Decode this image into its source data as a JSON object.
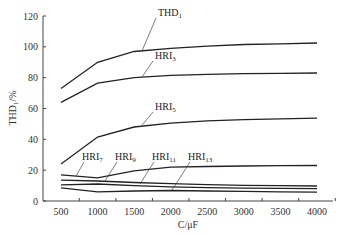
{
  "chart_data": {
    "type": "line",
    "title": "",
    "xlabel": "C/μF",
    "ylabel": "THD₁/%",
    "xlim": [
      500,
      4000
    ],
    "ylim": [
      0,
      120
    ],
    "grid": false,
    "legend": "inline labels with leader lines",
    "x_ticks": [
      500,
      1000,
      1500,
      2000,
      2500,
      3000,
      3500,
      4000
    ],
    "y_ticks": [
      0,
      20,
      40,
      60,
      80,
      100,
      120
    ],
    "series": [
      {
        "name": "THD1",
        "label_main": "THD",
        "label_sub": "1",
        "x": [
          500,
          1000,
          1500,
          2000,
          2500,
          3000,
          3500,
          4000
        ],
        "values": [
          73,
          90,
          97,
          99,
          100.5,
          101.5,
          102,
          102.5
        ]
      },
      {
        "name": "HRI3",
        "label_main": "HRI",
        "label_sub": "3",
        "x": [
          500,
          1000,
          1500,
          2000,
          2500,
          3000,
          3500,
          4000
        ],
        "values": [
          64,
          76.5,
          80,
          81.5,
          82.2,
          82.6,
          82.8,
          83
        ]
      },
      {
        "name": "HRI5",
        "label_main": "HRI",
        "label_sub": "5",
        "x": [
          500,
          1000,
          1500,
          2000,
          2500,
          3000,
          3500,
          4000
        ],
        "values": [
          24,
          41.5,
          48,
          50.5,
          52,
          52.8,
          53.3,
          53.8
        ]
      },
      {
        "name": "HRI7",
        "label_main": "HRI",
        "label_sub": "7",
        "x": [
          500,
          1000,
          1500,
          2000,
          2500,
          3000,
          3500,
          4000
        ],
        "values": [
          17,
          15,
          19.5,
          22,
          22.4,
          22.7,
          22.9,
          23
        ]
      },
      {
        "name": "HRI9",
        "label_main": "HRI",
        "label_sub": "9",
        "x": [
          500,
          1000,
          1500,
          2000,
          2500,
          3000,
          3500,
          4000
        ],
        "values": [
          13.5,
          13,
          12,
          11.2,
          10.6,
          10.2,
          9.9,
          9.7
        ]
      },
      {
        "name": "HRI11",
        "label_main": "HRI",
        "label_sub": "11",
        "x": [
          500,
          1000,
          1500,
          2000,
          2500,
          3000,
          3500,
          4000
        ],
        "values": [
          10.5,
          11,
          10,
          9.2,
          8.7,
          8.4,
          8.2,
          8
        ]
      },
      {
        "name": "HRI13",
        "label_main": "HRI",
        "label_sub": "13",
        "x": [
          500,
          1000,
          1500,
          2000,
          2500,
          3000,
          3500,
          4000
        ],
        "values": [
          8.5,
          6,
          6.5,
          6.8,
          6.5,
          6.2,
          6,
          5.8
        ]
      }
    ]
  }
}
